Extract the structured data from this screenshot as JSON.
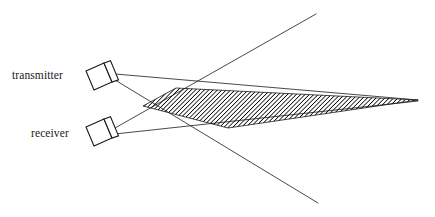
{
  "diagram": {
    "background_color": "#ffffff",
    "line_color": "#1a1a1a",
    "hatch_color": "#000000",
    "labels": {
      "transmitter": "transmitter",
      "receiver": "receiver"
    },
    "devices": [
      {
        "name": "transmitter",
        "label": "transmitter",
        "body_points": "86,71 104,63 112,82 94,90",
        "face_points": "104,63 110,61 118,80 112,82",
        "center": [
          101,
          76
        ]
      },
      {
        "name": "receiver",
        "label": "receiver",
        "body_points": "86,127 104,119 112,138 94,146",
        "face_points": "104,119 110,117 118,136 112,138",
        "center": [
          101,
          132
        ]
      }
    ],
    "rays": [
      {
        "name": "transmitter-upper-ray",
        "from": [
          115,
          74
        ],
        "to": [
          418,
          100
        ]
      },
      {
        "name": "transmitter-lower-ray",
        "from": [
          115,
          80
        ],
        "to": [
          318,
          203
        ]
      },
      {
        "name": "receiver-upper-ray",
        "from": [
          115,
          128
        ],
        "to": [
          316,
          14
        ]
      },
      {
        "name": "receiver-lower-ray",
        "from": [
          115,
          134
        ],
        "to": [
          418,
          101
        ]
      }
    ],
    "overlap_region": {
      "name": "beam-overlap-wedge",
      "points": "143,106 176,88 418,100 228,128",
      "hatch_angle_deg": 45,
      "hatch_spacing_px": 3,
      "description": "hatched lens-shaped intersection of the transmitter and receiver beams"
    },
    "label_positions": {
      "transmitter": [
        12,
        79
      ],
      "receiver": [
        31,
        137
      ]
    }
  }
}
